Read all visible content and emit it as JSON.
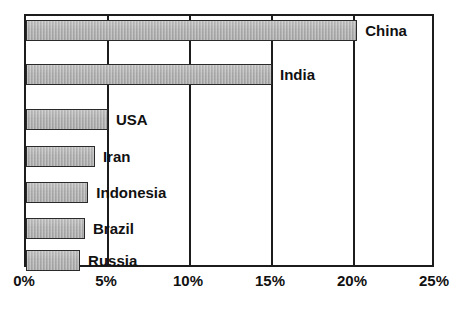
{
  "chart_data": {
    "type": "bar",
    "orientation": "horizontal",
    "title": "",
    "subtitle": "",
    "xlabel": "",
    "ylabel": "",
    "categories": [
      "China",
      "India",
      "USA",
      "Iran",
      "Indonesia",
      "Brazil",
      "Russia"
    ],
    "values": [
      20.2,
      15.0,
      5.0,
      4.2,
      3.8,
      3.6,
      3.3
    ],
    "value_unit": "%",
    "xlim": [
      0,
      25
    ],
    "xticks": [
      0,
      5,
      10,
      15,
      20,
      25
    ],
    "xtick_labels": [
      "0%",
      "5%",
      "10%",
      "15%",
      "20%",
      "25%"
    ],
    "grid": true,
    "grid_axis": "x",
    "legend": false,
    "legend_position": "none",
    "bar_fill_color": "#a9a9a9",
    "bar_border_color": "#2a2a2a",
    "frame_color": "#1c1c1c",
    "background_color": "#ffffff",
    "text_color": "#111111",
    "series": [
      {
        "name": "Share",
        "points": [
          {
            "category": "China",
            "value": 20.2,
            "label": "China"
          },
          {
            "category": "India",
            "value": 15.0,
            "label": "India"
          },
          {
            "category": "USA",
            "value": 5.0,
            "label": "USA"
          },
          {
            "category": "Iran",
            "value": 4.2,
            "label": "Iran"
          },
          {
            "category": "Indonesia",
            "value": 3.8,
            "label": "Indonesia"
          },
          {
            "category": "Brazil",
            "value": 3.6,
            "label": "Brazil"
          },
          {
            "category": "Russia",
            "value": 3.3,
            "label": "Russia"
          }
        ]
      }
    ]
  }
}
